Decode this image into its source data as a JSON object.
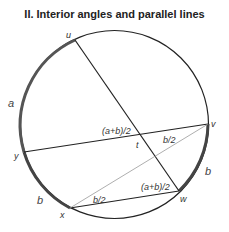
{
  "title": "II. Interior angles and parallel lines",
  "colors": {
    "circle": "#222222",
    "arc_highlight": "#555555",
    "chord": "#222222",
    "thin_chord": "#999999",
    "text": "#333333"
  },
  "circle": {
    "cx": 114.5,
    "cy": 124.5,
    "r": 94
  },
  "points": {
    "u": {
      "label": "u",
      "x": 75,
      "y": 40
    },
    "v": {
      "label": "v",
      "x": 208,
      "y": 124
    },
    "w": {
      "label": "w",
      "x": 179,
      "y": 191
    },
    "x": {
      "label": "x",
      "x": 70,
      "y": 208
    },
    "y": {
      "label": "y",
      "x": 24,
      "y": 152
    },
    "t": {
      "label": "t",
      "x": 140,
      "y": 135
    }
  },
  "chords": [
    {
      "from": "u",
      "to": "w",
      "style": "thick"
    },
    {
      "from": "y",
      "to": "v",
      "style": "thick"
    },
    {
      "from": "x",
      "to": "w",
      "style": "thick"
    },
    {
      "from": "x",
      "to": "v",
      "style": "thin"
    }
  ],
  "arcs": [
    {
      "name": "arc-a",
      "label": "a",
      "from": "u",
      "to": "y"
    },
    {
      "name": "arc-b-left",
      "label": "b",
      "from": "y",
      "to": "x"
    },
    {
      "name": "arc-b-right",
      "label": "b",
      "from": "v",
      "to": "w"
    }
  ],
  "angle_labels": {
    "at_t": "(a+b)/2",
    "at_v": "b/2",
    "at_w": "(a+b)/2",
    "at_x": "b/2"
  },
  "arc_labels": {
    "a": "a",
    "b_left": "b",
    "b_right": "b"
  }
}
